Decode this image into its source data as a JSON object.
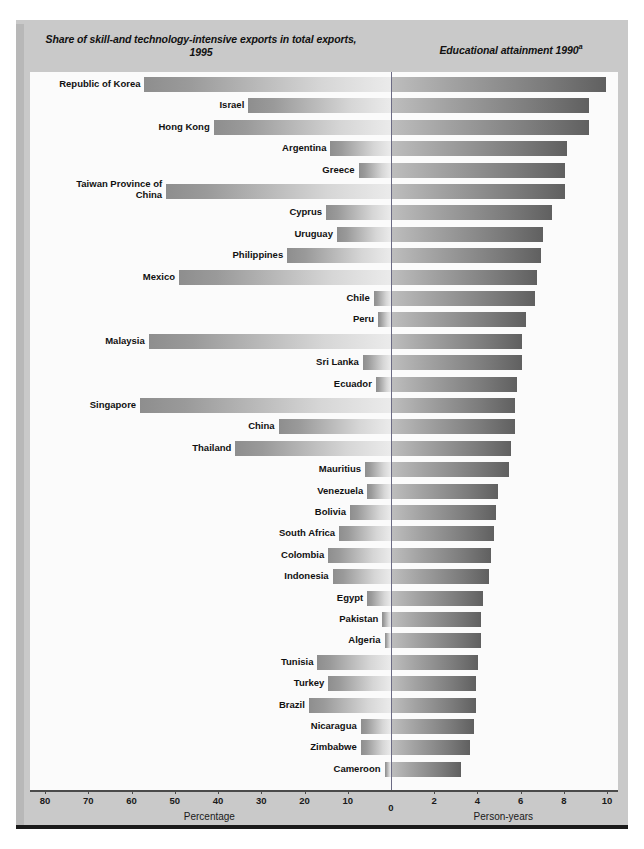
{
  "headers": {
    "left": "Share of skill-and technology-intensive exports in total exports, 1995",
    "right": "Educational attainment 1990",
    "right_footnote": "a"
  },
  "axis": {
    "left_caption": "Percentage",
    "right_caption": "Person-years",
    "left_ticks": [
      80,
      70,
      60,
      50,
      40,
      30,
      20,
      10
    ],
    "zero_tick": 0,
    "right_ticks": [
      2,
      4,
      6,
      8,
      10
    ],
    "left_max": 80,
    "right_max": 10
  },
  "colors": {
    "panel_background": "#c9c9c9",
    "plot_background": "#fbfbfb",
    "rule": "#1a1a1a",
    "zero_axis": "#6b6b84",
    "bar_left_light": "#ebebeb",
    "bar_left_dark": "#8e8e8e",
    "bar_right_light": "#bdbdbd",
    "bar_right_dark": "#606060"
  },
  "chart_data": {
    "type": "bar",
    "orientation": "horizontal-diverging",
    "xlabel_left": "Percentage",
    "xlabel_right": "Person-years",
    "ylabel": "",
    "xlim_left": [
      0,
      80
    ],
    "xlim_right": [
      0,
      10
    ],
    "grid": false,
    "legend": "none",
    "categories": [
      "Republic of Korea",
      "Israel",
      "Hong Kong",
      "Argentina",
      "Greece",
      "Taiwan Province of China",
      "Cyprus",
      "Uruguay",
      "Philippines",
      "Mexico",
      "Chile",
      "Peru",
      "Malaysia",
      "Sri Lanka",
      "Ecuador",
      "Singapore",
      "China",
      "Thailand",
      "Mauritius",
      "Venezuela",
      "Bolivia",
      "South Africa",
      "Colombia",
      "Indonesia",
      "Egypt",
      "Pakistan",
      "Algeria",
      "Tunisia",
      "Turkey",
      "Brazil",
      "Nicaragua",
      "Zimbabwe",
      "Cameroon"
    ],
    "series": [
      {
        "name": "Share of skill-and technology-intensive exports in total exports, 1995",
        "unit": "Percentage",
        "side": "left",
        "values": [
          57.0,
          33.0,
          41.0,
          14.0,
          7.5,
          52.0,
          15.0,
          12.5,
          24.0,
          49.0,
          4.0,
          3.0,
          56.0,
          6.5,
          3.5,
          58.0,
          26.0,
          36.0,
          6.0,
          5.5,
          9.5,
          12.0,
          14.5,
          13.5,
          5.5,
          2.0,
          1.5,
          17.0,
          14.5,
          19.0,
          7.0,
          7.0,
          1.5
        ]
      },
      {
        "name": "Educational attainment 1990",
        "unit": "Person-years",
        "side": "right",
        "values": [
          9.9,
          9.1,
          9.1,
          8.1,
          8.0,
          8.0,
          7.4,
          7.0,
          6.9,
          6.7,
          6.6,
          6.2,
          6.0,
          6.0,
          5.8,
          5.7,
          5.7,
          5.5,
          5.4,
          4.9,
          4.8,
          4.7,
          4.6,
          4.5,
          4.2,
          4.1,
          4.1,
          4.0,
          3.9,
          3.9,
          3.8,
          3.6,
          3.2
        ]
      }
    ]
  }
}
